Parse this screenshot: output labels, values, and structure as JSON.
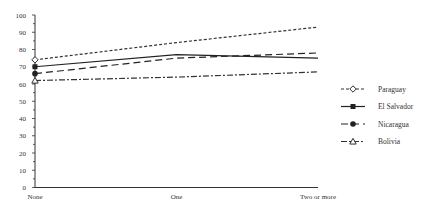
{
  "chart_data": {
    "type": "line",
    "title": "",
    "xlabel": "",
    "ylabel": "",
    "categories": [
      "None",
      "One",
      "Two or more"
    ],
    "ylim": [
      0,
      100
    ],
    "yticks": [
      0,
      10,
      20,
      30,
      40,
      50,
      60,
      70,
      80,
      90,
      100
    ],
    "grid": false,
    "legend_position": "right",
    "series": [
      {
        "name": "Paraguay",
        "values": [
          74,
          84,
          93
        ],
        "marker": "diamond-open",
        "line": "short-dash",
        "color": "#333333"
      },
      {
        "name": "El Salvador",
        "values": [
          70,
          77,
          75
        ],
        "marker": "square-filled",
        "line": "solid",
        "color": "#222222"
      },
      {
        "name": "Nicaragua",
        "values": [
          66,
          75,
          78
        ],
        "marker": "circle-filled",
        "line": "long-dash",
        "color": "#222222"
      },
      {
        "name": "Bolivia",
        "values": [
          62,
          64,
          67
        ],
        "marker": "triangle-open",
        "line": "dash-dot",
        "color": "#333333"
      }
    ]
  },
  "axis": {
    "x_labels": [
      "None",
      "One",
      "Two or more"
    ],
    "y_labels": [
      "0",
      "10",
      "20",
      "30",
      "40",
      "50",
      "60",
      "70",
      "80",
      "90",
      "100"
    ]
  },
  "legend": {
    "items": [
      "Paraguay",
      "El Salvador",
      "Nicaragua",
      "Bolivia"
    ]
  }
}
